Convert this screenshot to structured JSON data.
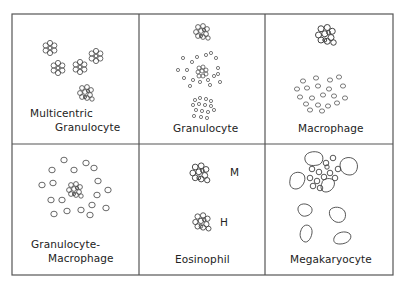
{
  "figure": {
    "line_color": "#444444",
    "panels": [
      {
        "id": "multicentric-granulocyte",
        "label_line1": "Multicentric",
        "label_line2": "Granulocyte"
      },
      {
        "id": "granulocyte",
        "label": "Granulocyte"
      },
      {
        "id": "macrophage",
        "label": "Macrophage"
      },
      {
        "id": "granulocyte-macrophage",
        "label_line1": "Granulocyte-",
        "label_line2": "Macrophage"
      },
      {
        "id": "eosinophil",
        "label": "Eosinophil",
        "marker_m": "M",
        "marker_h": "H"
      },
      {
        "id": "megakaryocyte",
        "label": "Megakaryocyte"
      }
    ]
  }
}
